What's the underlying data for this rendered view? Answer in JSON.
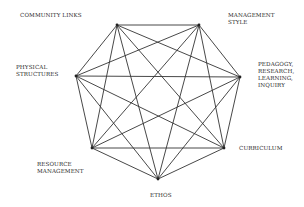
{
  "diagram": {
    "type": "complete-graph-heptagon",
    "line_color": "#333333",
    "nodes": [
      {
        "id": "community-links",
        "label": "COMMUNITY LINKS",
        "x": 117,
        "y": 25,
        "label_x": 20,
        "label_y": 12
      },
      {
        "id": "management-style",
        "label": "MANAGEMENT\nSTYLE",
        "x": 199,
        "y": 25,
        "label_x": 228,
        "label_y": 12
      },
      {
        "id": "pedagogy",
        "label": "PEDAGOGY,\nRESEARCH,\nLEARNING,\nINQUIRY",
        "x": 240,
        "y": 77,
        "label_x": 258,
        "label_y": 61
      },
      {
        "id": "curriculum",
        "label": "CURRICULUM",
        "x": 224,
        "y": 148,
        "label_x": 239,
        "label_y": 145
      },
      {
        "id": "ethos",
        "label": "ETHOS",
        "x": 158,
        "y": 179,
        "label_x": 150,
        "label_y": 192
      },
      {
        "id": "resource-management",
        "label": "RESOURCE\nMANAGEMENT",
        "x": 92,
        "y": 148,
        "label_x": 37,
        "label_y": 161
      },
      {
        "id": "physical-structures",
        "label": "PHYSICAL\nSTRUCTURES",
        "x": 76,
        "y": 76,
        "label_x": 16,
        "label_y": 64
      }
    ]
  }
}
